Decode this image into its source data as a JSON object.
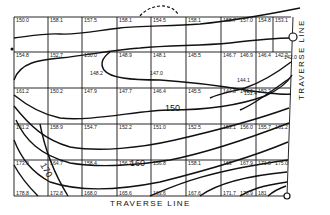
{
  "traverse_labels": {
    "bottom": "TRAVERSE LINE",
    "right": "TRAVERSE LINE"
  },
  "contour_labels": [
    {
      "id": "c150",
      "text": "150"
    },
    {
      "id": "c160",
      "text": "160"
    },
    {
      "id": "c170",
      "text": "170"
    }
  ],
  "spot_elevations": [
    {
      "row": 0,
      "col": 0,
      "text": "150.0"
    },
    {
      "row": 0,
      "col": 1,
      "text": "158.1"
    },
    {
      "row": 0,
      "col": 2,
      "text": "157.5"
    },
    {
      "row": 0,
      "col": 3,
      "text": "158.1"
    },
    {
      "row": 0,
      "col": 4,
      "text": "154.5"
    },
    {
      "row": 0,
      "col": 5,
      "text": "158.1"
    },
    {
      "row": 0,
      "col": 6,
      "text": "158.7"
    },
    {
      "row": 0,
      "col": 7,
      "text": "157.0"
    },
    {
      "row": 0,
      "col": 8,
      "text": "154.8"
    },
    {
      "row": 0,
      "col": 9,
      "text": "153.1"
    },
    {
      "row": 1,
      "col": 0,
      "text": "154.8"
    },
    {
      "row": 1,
      "col": 1,
      "text": "152.7"
    },
    {
      "row": 1,
      "col": 2,
      "text": "150.0"
    },
    {
      "row": 1,
      "col": 3,
      "text": "148.9"
    },
    {
      "row": 1,
      "col": 4,
      "text": "148.1"
    },
    {
      "row": 1,
      "col": 5,
      "text": "145.5"
    },
    {
      "row": 1,
      "col": 6,
      "text": "146.7"
    },
    {
      "row": 1,
      "col": 7,
      "text": "146.9"
    },
    {
      "row": 1,
      "col": 8,
      "text": "146.4"
    },
    {
      "row": 1,
      "col": 9,
      "text": "142.3"
    },
    {
      "row": 2,
      "col": 0,
      "text": "161.2"
    },
    {
      "row": 2,
      "col": 1,
      "text": "150.2"
    },
    {
      "row": 2,
      "col": 2,
      "text": "147.9"
    },
    {
      "row": 2,
      "col": 3,
      "text": "147.7"
    },
    {
      "row": 2,
      "col": 4,
      "text": "146.4"
    },
    {
      "row": 2,
      "col": 5,
      "text": "145.5"
    },
    {
      "row": 2,
      "col": 6,
      "text": "144.8"
    },
    {
      "row": 2,
      "col": 7,
      "text": "144.6"
    },
    {
      "row": 2,
      "col": 8,
      "text": "153.3"
    },
    {
      "row": 3,
      "col": 0,
      "text": "161.2"
    },
    {
      "row": 3,
      "col": 1,
      "text": "158.9"
    },
    {
      "row": 3,
      "col": 2,
      "text": "154.7"
    },
    {
      "row": 3,
      "col": 3,
      "text": "152.2"
    },
    {
      "row": 3,
      "col": 4,
      "text": "151.0"
    },
    {
      "row": 3,
      "col": 5,
      "text": "152.5"
    },
    {
      "row": 3,
      "col": 6,
      "text": "153.1"
    },
    {
      "row": 3,
      "col": 7,
      "text": "156.0"
    },
    {
      "row": 3,
      "col": 8,
      "text": "155.7"
    },
    {
      "row": 3,
      "col": 9,
      "text": "161.2"
    },
    {
      "row": 4,
      "col": 0,
      "text": "173.9"
    },
    {
      "row": 4,
      "col": 1,
      "text": "164.7"
    },
    {
      "row": 4,
      "col": 2,
      "text": "158.4"
    },
    {
      "row": 4,
      "col": 3,
      "text": "156.7"
    },
    {
      "row": 4,
      "col": 4,
      "text": "156.8"
    },
    {
      "row": 4,
      "col": 5,
      "text": "158.1"
    },
    {
      "row": 4,
      "col": 6,
      "text": "163"
    },
    {
      "row": 4,
      "col": 7,
      "text": "167.9"
    },
    {
      "row": 4,
      "col": 8,
      "text": "171.8"
    },
    {
      "row": 4,
      "col": 9,
      "text": "175.0"
    },
    {
      "row": 5,
      "col": 0,
      "text": "178.8"
    },
    {
      "row": 5,
      "col": 1,
      "text": "172.8"
    },
    {
      "row": 5,
      "col": 2,
      "text": "168.0"
    },
    {
      "row": 5,
      "col": 3,
      "text": "165.6"
    },
    {
      "row": 5,
      "col": 4,
      "text": "163.6"
    },
    {
      "row": 5,
      "col": 5,
      "text": "167.6"
    },
    {
      "row": 5,
      "col": 6,
      "text": "171.7"
    },
    {
      "row": 5,
      "col": 7,
      "text": "176.9"
    },
    {
      "row": 5,
      "col": 8,
      "text": "181"
    }
  ],
  "interior_points": [
    {
      "id": "p1482",
      "text": "148.2"
    },
    {
      "id": "p1470",
      "text": "147.0"
    },
    {
      "id": "p1441",
      "text": "144.1"
    },
    {
      "id": "p1514",
      "text": "151.4"
    },
    {
      "id": "p1420",
      "text": "142.0"
    }
  ]
}
